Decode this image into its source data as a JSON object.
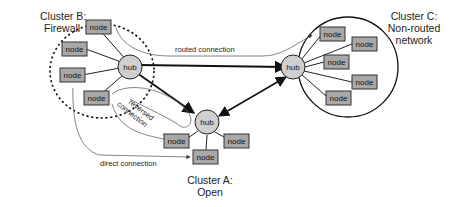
{
  "colors": {
    "node_fill": "#a8a8a8",
    "hub_fill": "#cfcfcf",
    "stroke": "#222222",
    "thin_line": "#555555"
  },
  "clusters": {
    "b": {
      "title_line1": "Cluster B:",
      "title_line2": "Firewall"
    },
    "c": {
      "title_line1": "Cluster C:",
      "title_line2": "Non-routed",
      "title_line3": "network"
    },
    "a": {
      "title_line1": "Cluster A:",
      "title_line2": "Open"
    }
  },
  "hub_label": "hub",
  "node_label": "node",
  "connections": {
    "routed": "routed connection",
    "reversed_line1": "reversed",
    "reversed_line2": "connection",
    "direct": "direct connection"
  }
}
